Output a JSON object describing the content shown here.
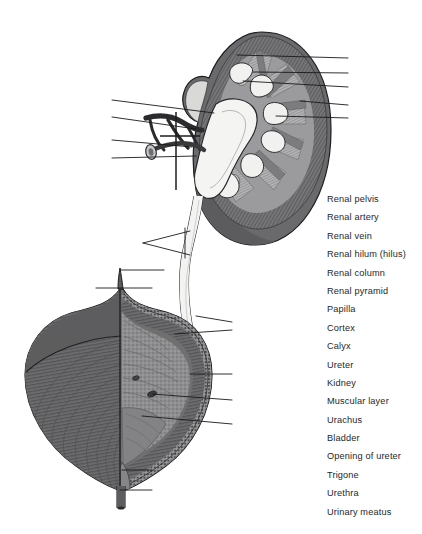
{
  "figure": {
    "colors": {
      "outline": "#1c1c1e",
      "cortex_dark": "#6e6e70",
      "cortex_mid": "#8a8a8c",
      "medulla_light": "#b9b9bb",
      "pelvis_white": "#f2f2f0",
      "vessel_dark": "#2b2b2d",
      "bladder_dark": "#5f5f61",
      "bladder_mid": "#7d7d7f",
      "mucosa_light": "#9d9d9f",
      "leader_line": "#1a1a1c",
      "label_text": "#26272b",
      "background": "#ffffff"
    }
  },
  "labels": [
    {
      "id": "renal-pelvis",
      "text": "Renal pelvis"
    },
    {
      "id": "renal-artery",
      "text": "Renal artery"
    },
    {
      "id": "renal-vein",
      "text": "Renal vein"
    },
    {
      "id": "renal-hilum",
      "text": "Renal hilum (hilus)"
    },
    {
      "id": "renal-column",
      "text": "Renal column"
    },
    {
      "id": "renal-pyramid",
      "text": "Renal pyramid"
    },
    {
      "id": "papilla",
      "text": "Papilla"
    },
    {
      "id": "cortex",
      "text": "Cortex"
    },
    {
      "id": "calyx",
      "text": "Calyx"
    },
    {
      "id": "ureter",
      "text": "Ureter"
    },
    {
      "id": "kidney",
      "text": "Kidney"
    },
    {
      "id": "muscular-layer",
      "text": "Muscular layer"
    },
    {
      "id": "urachus",
      "text": "Urachus"
    },
    {
      "id": "bladder",
      "text": "Bladder"
    },
    {
      "id": "opening-of-ureter",
      "text": "Opening of ureter"
    },
    {
      "id": "trigone",
      "text": "Trigone"
    },
    {
      "id": "urethra",
      "text": "Urethra"
    },
    {
      "id": "urinary-meatus",
      "text": "Urinary meatus"
    }
  ]
}
